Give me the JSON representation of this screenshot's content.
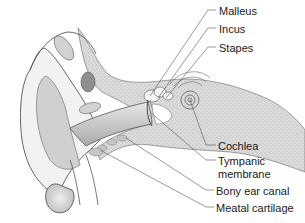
{
  "diagram": {
    "labels": [
      {
        "id": "malleus",
        "text": "Malleus",
        "x": 219,
        "y": 5
      },
      {
        "id": "incus",
        "text": "Incus",
        "x": 219,
        "y": 23
      },
      {
        "id": "stapes",
        "text": "Stapes",
        "x": 219,
        "y": 42
      },
      {
        "id": "cochlea",
        "text": "Cochlea",
        "x": 218,
        "y": 140
      },
      {
        "id": "tympanic",
        "text": "Tympanic",
        "x": 218,
        "y": 155
      },
      {
        "id": "membrane",
        "text": "membrane",
        "x": 218,
        "y": 168
      },
      {
        "id": "bony-canal",
        "text": "Bony ear canal",
        "x": 216,
        "y": 185
      },
      {
        "id": "meatal",
        "text": "Meatal cartilage",
        "x": 216,
        "y": 202
      }
    ],
    "colors": {
      "line": "#555555",
      "skin": "#efefef",
      "shade": "#bdbdbd",
      "bone": "#d6d6d6",
      "dark": "#8a8a8a"
    }
  }
}
